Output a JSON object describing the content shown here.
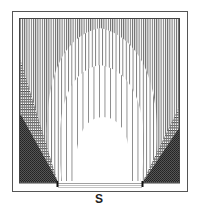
{
  "diagram": {
    "title": "",
    "opening_label": "S",
    "colors": {
      "frame": "#555555",
      "line": "#444444",
      "dark": "#1a1a1a",
      "background": "#ffffff"
    },
    "frame": {
      "outer": {
        "x": 12,
        "y": 11,
        "w": 175,
        "h": 180
      },
      "inner": {
        "x": 19,
        "y": 18,
        "w": 161,
        "h": 165
      },
      "opening": {
        "x1": 58,
        "x2": 142,
        "y": 183
      }
    },
    "zones": [
      {
        "name": "dense-vertical-lines",
        "description": "outer zone, densely spaced vertical lines"
      },
      {
        "name": "medium-vertical-lines",
        "description": "arch zone with medium spaced vertical lines",
        "top_y": 28
      },
      {
        "name": "sparse-vertical-lines",
        "description": "arch zone with sparse vertical lines",
        "top_y": 65
      },
      {
        "name": "unhatched-core",
        "description": "innermost white arch above opening",
        "top_y": 117
      },
      {
        "name": "horizontal-hatch",
        "description": "side triangles with horizontal hatching"
      },
      {
        "name": "cross-hatch",
        "description": "dark cross-hatched lower corners"
      }
    ]
  }
}
